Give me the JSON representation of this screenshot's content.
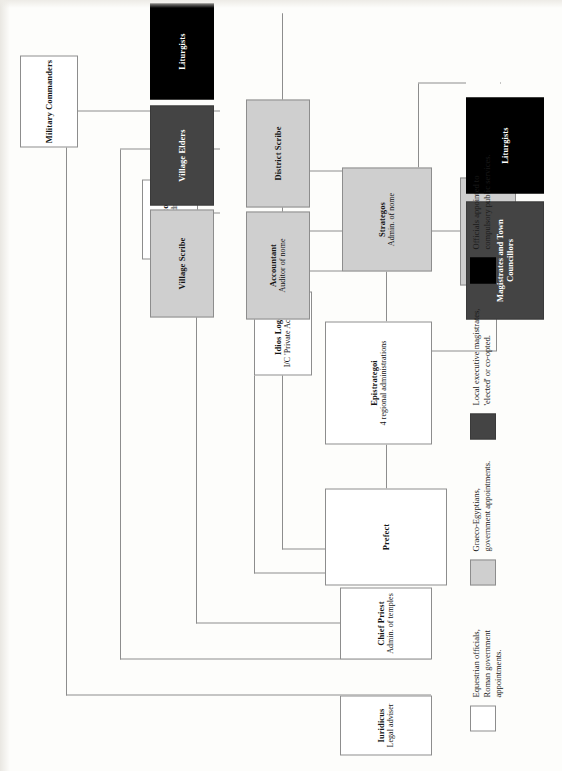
{
  "diagram": {
    "orientation": "rotated-90",
    "colors": {
      "white": "#ffffff",
      "gray": "#cfcfcf",
      "dark": "#444444",
      "black": "#000000",
      "line": "#8d8d8d",
      "page": "#fdfdfb"
    },
    "nodes": [
      {
        "id": "prefect",
        "title": "Prefect",
        "sub": "",
        "tier": "white"
      },
      {
        "id": "iuridicus",
        "title": "Iuridicus",
        "sub": "Legal adviser",
        "tier": "white"
      },
      {
        "id": "chief-priest",
        "title": "Chief Priest",
        "sub": "Admin. of temples",
        "tier": "white"
      },
      {
        "id": "dioiketes",
        "title": "Dioiketes",
        "sub": "Finance officer",
        "tier": "white"
      },
      {
        "id": "idios-logos",
        "title": "Idios Logos",
        "sub": "I/C 'Private Account'",
        "tier": "white"
      },
      {
        "id": "procurators",
        "title": "Procurators",
        "sub": "Financial admin.",
        "tier": "white"
      },
      {
        "id": "military",
        "title": "Military Commanders",
        "sub": "",
        "tier": "white"
      },
      {
        "id": "epistrategoi",
        "title": "Epistrategoi",
        "sub": "4 regional administrations",
        "tier": "white"
      },
      {
        "id": "strategos",
        "title": "Strategos",
        "sub": "Admin. of nome",
        "tier": "gray"
      },
      {
        "id": "royal-scribe",
        "title": "Royal Scribe",
        "sub": "Secretary of nome",
        "tier": "gray"
      },
      {
        "id": "accountant",
        "title": "Accountant",
        "sub": "Auditor of nome",
        "tier": "gray"
      },
      {
        "id": "district-scribe",
        "title": "District Scribe",
        "sub": "",
        "tier": "gray"
      },
      {
        "id": "village-scribe",
        "title": "Village Scribe",
        "sub": "",
        "tier": "gray"
      },
      {
        "id": "village-elders",
        "title": "Village Elders",
        "sub": "",
        "tier": "dark"
      },
      {
        "id": "magistrates",
        "title": "Magistrates and Town Councillors",
        "sub": "",
        "tier": "dark"
      },
      {
        "id": "liturgists-1",
        "title": "Liturgists",
        "sub": "",
        "tier": "black"
      },
      {
        "id": "liturgists-2",
        "title": "Liturgists",
        "sub": "",
        "tier": "black"
      }
    ],
    "legend": [
      {
        "swatch": "white",
        "text": "Equestrian officials,\nRoman government\nappointments."
      },
      {
        "swatch": "gray",
        "text": "Graeco-Egyptians,\ngovernment appointments."
      },
      {
        "swatch": "dark",
        "text": "Local executive magistrates,\n'elected' or co-opted."
      },
      {
        "swatch": "black",
        "text": "Officials appointed to\ncompulsory public services."
      }
    ]
  }
}
